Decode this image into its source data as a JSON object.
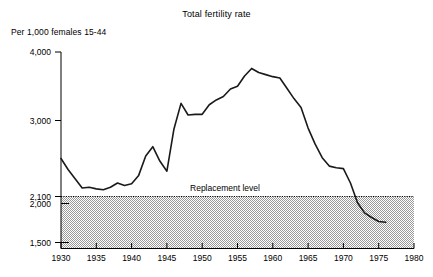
{
  "chart_data": {
    "type": "line",
    "title": "Total fertility rate",
    "ylabel": "Per 1,000 females 15-44",
    "xlabel": "",
    "xlim": [
      1930,
      1980
    ],
    "ylim": [
      1500,
      4000
    ],
    "grid": false,
    "legend": "none",
    "y_ticks": [
      "4,000",
      "3,000",
      "2,100",
      "2,000",
      "1,500"
    ],
    "y_tick_values": [
      4000,
      3000,
      2100,
      2000,
      1500
    ],
    "x_ticks": [
      "1930",
      "1935",
      "1940",
      "1945",
      "1950",
      "1955",
      "1960",
      "1965",
      "1970",
      "1975",
      "1980"
    ],
    "x_tick_values": [
      1930,
      1935,
      1940,
      1945,
      1950,
      1955,
      1960,
      1965,
      1970,
      1975,
      1980
    ],
    "annotations": [
      {
        "name": "replacement-level",
        "label": "Replacement level",
        "value": 2100,
        "style": "dotted-horizontal-line",
        "shaded_below": true
      }
    ],
    "series": [
      {
        "name": "Total fertility rate",
        "color": "#1a1a1a",
        "x": [
          1930,
          1931,
          1932,
          1933,
          1934,
          1935,
          1936,
          1937,
          1938,
          1939,
          1940,
          1941,
          1942,
          1943,
          1944,
          1945,
          1946,
          1947,
          1948,
          1949,
          1950,
          1951,
          1952,
          1953,
          1954,
          1955,
          1956,
          1957,
          1958,
          1959,
          1960,
          1961,
          1962,
          1963,
          1964,
          1965,
          1966,
          1967,
          1968,
          1969,
          1970,
          1971,
          1972,
          1973,
          1974,
          1975,
          1976
        ],
        "y": [
          2550,
          2420,
          2310,
          2200,
          2210,
          2190,
          2180,
          2210,
          2260,
          2230,
          2250,
          2350,
          2580,
          2690,
          2520,
          2400,
          2900,
          3250,
          3080,
          3090,
          3090,
          3230,
          3300,
          3350,
          3460,
          3500,
          3650,
          3760,
          3700,
          3670,
          3640,
          3620,
          3470,
          3320,
          3190,
          2910,
          2720,
          2560,
          2460,
          2440,
          2430,
          2260,
          2010,
          1880,
          1820,
          1770,
          1760
        ]
      }
    ]
  }
}
